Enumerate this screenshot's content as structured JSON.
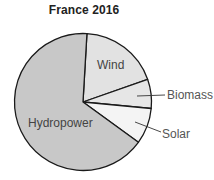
{
  "title": "France 2016",
  "chart_data": {
    "type": "pie",
    "title": "France 2016",
    "start_angle_deg": 3.3,
    "direction": "clockwise",
    "slices": [
      {
        "label": "Wind",
        "percent": 18.7,
        "color": "#e2e2e2",
        "label_position": "inside"
      },
      {
        "label": "Biomass",
        "percent": 6.9,
        "color": "#e6e6e6",
        "label_position": "outside"
      },
      {
        "label": "Solar",
        "percent": 8.5,
        "color": "#f4f4f4",
        "label_position": "outside"
      },
      {
        "label": "Hydropower",
        "percent": 65.9,
        "color": "#c8c8c8",
        "label_position": "inside"
      }
    ],
    "legend": "none",
    "stroke_color": "#1a1a1a"
  },
  "labels": {
    "wind": "Wind",
    "biomass": "Biomass",
    "solar": "Solar",
    "hydropower": "Hydropower"
  }
}
